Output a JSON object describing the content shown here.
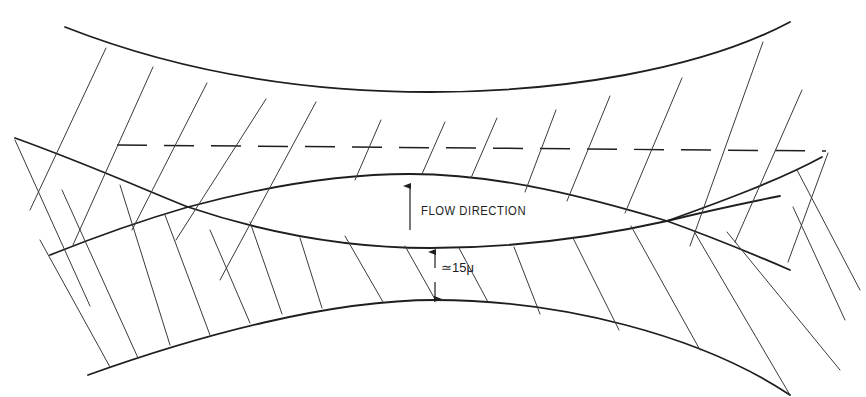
{
  "diagram": {
    "labels": {
      "flow": "FLOW DIRECTION",
      "gap": "≃15μ"
    },
    "colors": {
      "line": "#1e1e1e",
      "background": "#ffffff"
    },
    "elements": {
      "upper_band": "upper fiber layer (hatched, fibers leaning right)",
      "lower_band": "lower fiber layer (hatched, fibers leaning left)",
      "flow_channel": "lens-shaped gap between layers",
      "centerline": "dashed reference line",
      "flow_arrow": "upward arrow",
      "gap_dimension": "double arrow between lower band edges"
    }
  }
}
